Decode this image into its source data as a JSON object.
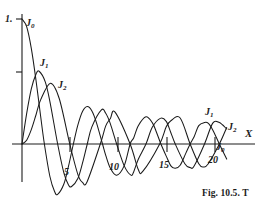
{
  "figure": {
    "caption": "Fig. 10.5. T",
    "axis_x_label": "X",
    "axis_y_top_label": "1."
  },
  "axes": {
    "x_tick_labels": [
      "5",
      "10",
      "15",
      "20"
    ],
    "x_tick_values": [
      5,
      10,
      15,
      20
    ],
    "y_tick_values": [
      0.5
    ],
    "x_range": [
      0,
      23
    ],
    "y_range": [
      -1.05,
      1.05
    ]
  },
  "series_labels": {
    "j0_left": "J",
    "j0_left_sub": "0",
    "j1_left": "J",
    "j1_left_sub": "1",
    "j2_left": "J",
    "j2_left_sub": "2",
    "j1_right": "J",
    "j1_right_sub": "1",
    "j2_right": "J",
    "j2_right_sub": "2",
    "j0_right": "J",
    "j0_right_sub": "0"
  },
  "chart_data": {
    "type": "line",
    "title": "Fig. 10.5. T",
    "xlabel": "X",
    "ylabel": "",
    "xlim": [
      0,
      23
    ],
    "ylim": [
      -1.05,
      1.05
    ],
    "grid": false,
    "legend": "inline-annotations",
    "xticks": [
      5,
      10,
      15,
      20
    ],
    "yticks": [
      0.5,
      1.0
    ],
    "ytick_labels": [
      "",
      "1."
    ],
    "series": [
      {
        "name": "J0",
        "x": [
          0,
          0.5,
          1,
          1.5,
          2,
          2.4048,
          3,
          3.5,
          3.8317,
          4.5,
          5,
          5.5202,
          6,
          6.5,
          7.0156,
          7.5,
          8,
          8.6537,
          9,
          9.5,
          10.1735,
          11,
          11.6198,
          12,
          12.5,
          13.3237,
          14,
          14.4,
          14.9309,
          15.5,
          16,
          16.4706,
          17,
          17.6,
          18.0711,
          18.5,
          19,
          19.6159,
          20,
          20.5,
          21.2116,
          22
        ],
        "y": [
          1.0,
          0.9385,
          0.7652,
          0.5118,
          0.2239,
          0.0,
          -0.2601,
          -0.3801,
          -0.4028,
          -0.3205,
          -0.1776,
          0.0,
          0.1506,
          0.2601,
          0.3001,
          0.2663,
          0.1717,
          0.0,
          -0.0903,
          -0.1939,
          -0.2497,
          -0.1712,
          0.0,
          0.0477,
          0.1469,
          0.2184,
          0.1711,
          0.1043,
          0.0,
          -0.0968,
          -0.1749,
          -0.1947,
          -0.1699,
          -0.0752,
          0.0,
          0.0581,
          0.1466,
          0.1717,
          0.167,
          0.1128,
          0.0,
          -0.1207
        ],
        "peak_value": 1.0,
        "first_zero": 2.4048
      },
      {
        "name": "J1",
        "x": [
          0,
          0.5,
          1,
          1.5,
          1.8412,
          2.5,
          3,
          3.8317,
          4.5,
          5,
          5.3314,
          6,
          6.5,
          7.0156,
          7.5,
          8.5363,
          9,
          9.5,
          10.1735,
          11,
          11.706,
          12,
          12.5,
          13.3237,
          14,
          14.8636,
          15.5,
          16,
          16.4706,
          17.5,
          18.0711,
          18.5,
          19.6159,
          20.5,
          21.2116,
          22
        ],
        "y": [
          0.0,
          0.2423,
          0.4401,
          0.5579,
          0.5819,
          0.4971,
          0.3391,
          0.0,
          -0.2311,
          -0.3276,
          -0.3403,
          -0.2767,
          -0.1538,
          0.0,
          0.1352,
          0.2731,
          0.2453,
          0.1613,
          0.0,
          -0.1768,
          -0.249,
          -0.2234,
          -0.1216,
          0.0,
          0.1334,
          0.2051,
          0.1813,
          0.0904,
          0.0,
          -0.1578,
          -0.188,
          -0.176,
          0.0,
          0.1666,
          0.1711,
          0.1207
        ],
        "peak_value": 0.5819,
        "peak_x": 1.8412
      },
      {
        "name": "J2",
        "x": [
          0,
          0.5,
          1,
          1.5,
          2,
          3.0542,
          4,
          5.1356,
          6,
          6.5,
          7,
          8.4172,
          9,
          9.5,
          10,
          11.6198,
          12.5,
          13,
          14.796,
          15.5,
          16,
          17,
          18.0711,
          19,
          19.5,
          20,
          21.2116,
          22
        ],
        "y": [
          0.0,
          0.0306,
          0.1149,
          0.2321,
          0.3528,
          0.4862,
          0.3641,
          0.0,
          -0.2429,
          -0.3074,
          -0.3014,
          0.0,
          0.1448,
          0.2041,
          0.2546,
          0.0,
          -0.2047,
          -0.2177,
          0.0,
          0.1378,
          0.1862,
          0.2079,
          0.0,
          -0.1578,
          -0.1835,
          -0.1603,
          0.0,
          0.1313
        ],
        "peak_value": 0.4862,
        "peak_x": 3.0542
      }
    ],
    "annotations": [
      {
        "text": "J0",
        "x_px": 28,
        "y_px": 22
      },
      {
        "text": "J1",
        "x_px": 42,
        "y_px": 62
      },
      {
        "text": "J2",
        "x_px": 60,
        "y_px": 84
      },
      {
        "text": "J1",
        "x_px": 208,
        "y_px": 111
      },
      {
        "text": "J2",
        "x_px": 229,
        "y_px": 126
      },
      {
        "text": "J0",
        "x_px": 218,
        "y_px": 146
      }
    ]
  }
}
